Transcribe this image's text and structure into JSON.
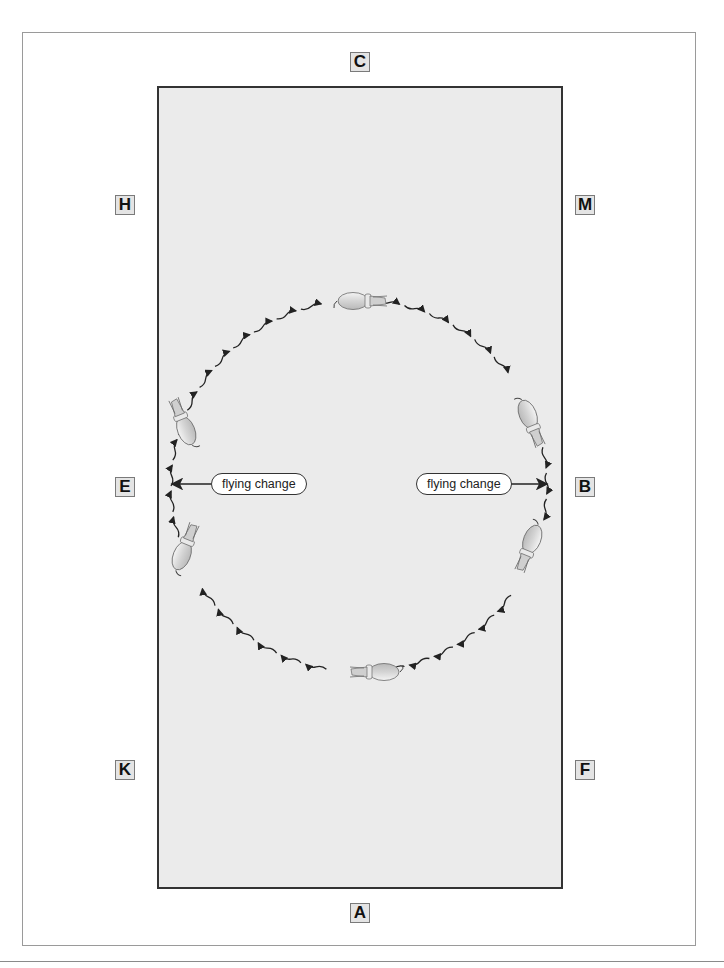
{
  "diagram": {
    "arena_markers": {
      "C": "C",
      "H": "H",
      "M": "M",
      "E": "E",
      "B": "B",
      "K": "K",
      "F": "F",
      "A": "A"
    },
    "callouts": {
      "left": "flying change",
      "right": "flying change"
    },
    "path": {
      "type": "circle",
      "style": "wavy hoof-track segments with arrowheads",
      "horses": [
        "top",
        "right-upper",
        "right-lower",
        "bottom",
        "left-upper",
        "left-lower"
      ]
    },
    "colors": {
      "arena_fill": "#ebebeb",
      "arena_border": "#333333",
      "marker_fill": "#e4e4e4",
      "frame": "#9a9a9a"
    }
  }
}
